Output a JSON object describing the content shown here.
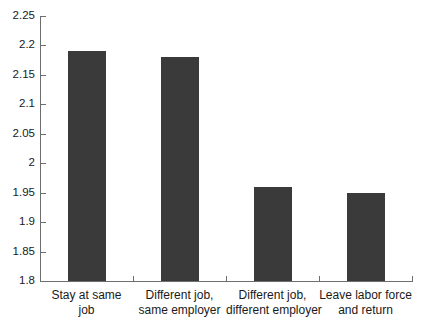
{
  "chart_data": {
    "type": "bar",
    "title": "",
    "subtitle": "",
    "xlabel": "",
    "ylabel": "",
    "ylim": [
      1.8,
      2.25
    ],
    "ytick_step": 0.05,
    "grid": false,
    "legend": false,
    "legend_position": "none",
    "bar_color": "#3a3a3a",
    "axis_color": "#6e6e6e",
    "background_color": "#ffffff",
    "categories": [
      "Stay at same job",
      "Different job, same employer",
      "Different job, different employer",
      "Leave labor force and return"
    ],
    "category_lines": [
      [
        "Stay at same",
        "job"
      ],
      [
        "Different job,",
        "same employer"
      ],
      [
        "Different job,",
        "different employer"
      ],
      [
        "Leave labor force",
        "and return"
      ]
    ],
    "values": [
      2.19,
      2.18,
      1.96,
      1.95
    ],
    "ytick_labels": [
      "2.25",
      "2.2",
      "2.15",
      "2.1",
      "2.05",
      "2",
      "1.95",
      "1.9",
      "1.85",
      "1.8"
    ],
    "ytick_values": [
      2.25,
      2.2,
      2.15,
      2.1,
      2.05,
      2.0,
      1.95,
      1.9,
      1.85,
      1.8
    ]
  }
}
